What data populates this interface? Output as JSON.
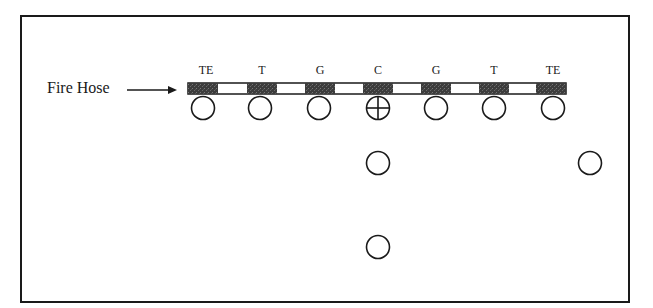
{
  "diagram": {
    "title_label": "Fire Hose",
    "arrow": "right-arrow",
    "line_positions": [
      {
        "label": "TE",
        "x": 203
      },
      {
        "label": "T",
        "x": 262
      },
      {
        "label": "G",
        "x": 320
      },
      {
        "label": "C",
        "x": 378
      },
      {
        "label": "G",
        "x": 436
      },
      {
        "label": "T",
        "x": 494
      },
      {
        "label": "TE",
        "x": 551
      }
    ],
    "players": [
      {
        "role": "line",
        "x": 203,
        "y": 108,
        "marked": false
      },
      {
        "role": "line",
        "x": 260,
        "y": 108,
        "marked": false
      },
      {
        "role": "line",
        "x": 319,
        "y": 108,
        "marked": false
      },
      {
        "role": "center",
        "x": 378,
        "y": 108,
        "marked": true
      },
      {
        "role": "line",
        "x": 436,
        "y": 108,
        "marked": false
      },
      {
        "role": "line",
        "x": 494,
        "y": 108,
        "marked": false
      },
      {
        "role": "line",
        "x": 553,
        "y": 108,
        "marked": false
      },
      {
        "role": "back",
        "x": 378,
        "y": 163,
        "marked": false
      },
      {
        "role": "wide",
        "x": 590,
        "y": 163,
        "marked": false
      },
      {
        "role": "deep-back",
        "x": 378,
        "y": 247,
        "marked": false
      }
    ],
    "colors": {
      "ink": "#1a1a1a",
      "block_fill": "#4a4a4a",
      "background": "#ffffff"
    }
  }
}
